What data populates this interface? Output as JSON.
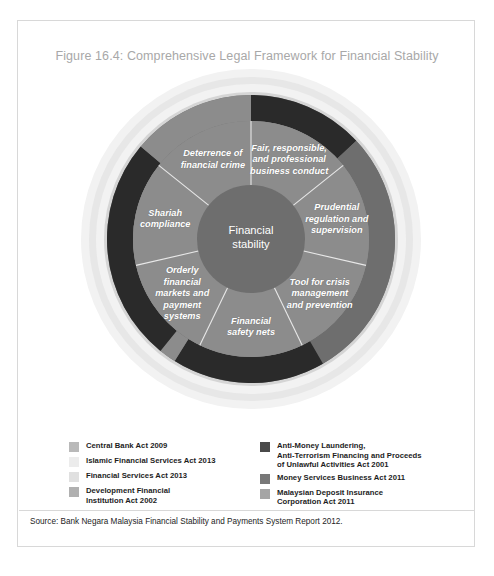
{
  "figure": {
    "title": "Figure 16.4: Comprehensive Legal Framework for Financial Stability",
    "source": "Source: Bank Negara Malaysia Financial Stability and Payments System Report 2012."
  },
  "chart_data": {
    "type": "pie",
    "title": "Figure 16.4: Comprehensive Legal Framework for Financial Stability",
    "center_label": "Financial\nstability",
    "legend_position": "bottom",
    "grid": false,
    "categories": [
      "Fair, responsible, and professional business conduct",
      "Prudential regulation and supervision",
      "Tool for crisis management and prevention",
      "Financial safety nets",
      "Orderly financial markets and payment systems",
      "Shariah compliance",
      "Deterrence of financial crime"
    ],
    "values": [
      14.29,
      14.29,
      14.29,
      14.29,
      14.29,
      14.29,
      14.29
    ],
    "segments": [
      {
        "label": "Fair, responsible,\nand professional\nbusiness conduct",
        "start_deg": 0,
        "end_deg": 51.4,
        "color": "#8c8c8c"
      },
      {
        "label": "Prudential\nregulation and\nsupervision",
        "start_deg": 51.4,
        "end_deg": 102.9,
        "color": "#8c8c8c"
      },
      {
        "label": "Tool for crisis\nmanagement\nand prevention",
        "start_deg": 102.9,
        "end_deg": 154.3,
        "color": "#8c8c8c"
      },
      {
        "label": "Financial\nsafety nets",
        "start_deg": 154.3,
        "end_deg": 205.7,
        "color": "#8c8c8c"
      },
      {
        "label": "Orderly\nfinancial\nmarkets and\npayment\nsystems",
        "start_deg": 205.7,
        "end_deg": 257.1,
        "color": "#8c8c8c"
      },
      {
        "label": "Shariah\ncompliance",
        "start_deg": 257.1,
        "end_deg": 308.6,
        "color": "#8c8c8c"
      },
      {
        "label": "Deterrence of\nfinancial crime",
        "start_deg": 308.6,
        "end_deg": 360,
        "color": "#8c8c8c"
      }
    ],
    "outer_ring_arcs": [
      {
        "name": "dark-arc-top-right",
        "start_deg": 0,
        "end_deg": 47,
        "color": "#2a2a2a"
      },
      {
        "name": "gray-arc-right",
        "start_deg": 47,
        "end_deg": 150,
        "color": "#6e6e6e"
      },
      {
        "name": "dark-arc-bottom",
        "start_deg": 150,
        "end_deg": 212,
        "color": "#2a2a2a"
      },
      {
        "name": "gray-arc-bottom-left",
        "start_deg": 212,
        "end_deg": 219,
        "color": "#8c8c8c"
      },
      {
        "name": "dark-arc-left",
        "start_deg": 219,
        "end_deg": 310,
        "color": "#2a2a2a"
      },
      {
        "name": "gray-arc-top",
        "start_deg": 310,
        "end_deg": 360,
        "color": "#8c8c8c"
      }
    ],
    "colors": {
      "inner_circle": "#6e6e6e",
      "mid_ring": "#8c8c8c",
      "outer_dark": "#2a2a2a",
      "outer_gray": "#6e6e6e",
      "halo_light": "#d5d5d5",
      "halo_lighter": "#e7e7e7",
      "halo_lightest": "#f2f2f2",
      "divider": "#e8e8e8",
      "label_text": "#ffffff",
      "title_text": "#a8a8a8"
    }
  },
  "legend": {
    "left": [
      {
        "label": "Central Bank Act 2009",
        "color": "#b9b9b9"
      },
      {
        "label": "Islamic Financial Services Act 2013",
        "color": "#ececec"
      },
      {
        "label": "Financial Services Act 2013",
        "color": "#e0e0e0"
      },
      {
        "label": "Development Financial\nInstitution Act 2002",
        "color": "#b0b0b0"
      }
    ],
    "right": [
      {
        "label": "Anti-Money Laundering,\nAnti-Terrorism Financing and Proceeds\nof Unlawful Activities Act 2001",
        "color": "#4a4a4a"
      },
      {
        "label": "Money Services Business Act 2011",
        "color": "#787878"
      },
      {
        "label": "Malaysian Deposit Insurance\nCorporation Act 2011",
        "color": "#a5a5a5"
      }
    ]
  }
}
